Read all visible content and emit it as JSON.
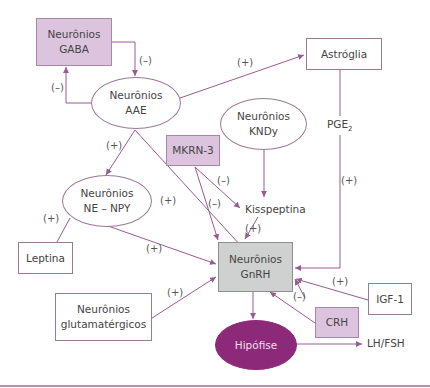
{
  "nodes": {
    "gaba": {
      "line1": "Neurônios",
      "line2": "GABA"
    },
    "aae": {
      "line1": "Neurônios",
      "line2": "AAE"
    },
    "astroglia": {
      "label": "Astróglia"
    },
    "kndy": {
      "line1": "Neurônios",
      "line2": "KNDy"
    },
    "mkrn3": {
      "label": "MKRN-3"
    },
    "ne_npy": {
      "line1": "Neurônios",
      "line2": "NE – NPY"
    },
    "kisspeptina": {
      "label": "Kisspeptina"
    },
    "leptina": {
      "label": "Leptina"
    },
    "gnrh": {
      "line1": "Neurônios",
      "line2": "GnRH"
    },
    "igf1": {
      "label": "IGF-1"
    },
    "glutamatergicos": {
      "line1": "Neurônios",
      "line2": "glutamatérgicos"
    },
    "crh": {
      "label": "CRH"
    },
    "hipofise": {
      "label": "Hipófise"
    },
    "lhfsh": {
      "label": "LH/FSH"
    },
    "pge2": {
      "base": "PGE",
      "sub": "2"
    }
  },
  "edges": [
    {
      "from": "Neurônios GABA",
      "to": "Neurônios AAE",
      "sign": "(–)"
    },
    {
      "from": "Neurônios AAE",
      "to": "Neurônios GABA",
      "sign": "(–)"
    },
    {
      "from": "Neurônios AAE",
      "to": "Astróglia",
      "sign": "(+)"
    },
    {
      "from": "Neurônios AAE",
      "to": "Neurônios NE – NPY",
      "sign": "(+)"
    },
    {
      "from": "Neurônios AAE",
      "to": "Neurônios GnRH",
      "sign": "(+)"
    },
    {
      "from": "Astróglia",
      "to": "Neurônios GnRH",
      "via": "PGE2",
      "sign": "(+)"
    },
    {
      "from": "Neurônios KNDy",
      "to": "Kisspeptina",
      "sign": ""
    },
    {
      "from": "MKRN-3",
      "to": "Kisspeptina",
      "sign": "(–)"
    },
    {
      "from": "MKRN-3",
      "to": "Neurônios GnRH",
      "sign": "(–)"
    },
    {
      "from": "Kisspeptina",
      "to": "Neurônios GnRH",
      "sign": "(+)"
    },
    {
      "from": "Leptina",
      "to": "Neurônios NE – NPY",
      "sign": "(+)"
    },
    {
      "from": "Neurônios NE – NPY",
      "to": "Neurônios GnRH",
      "sign": "(+)"
    },
    {
      "from": "Neurônios glutamatérgicos",
      "to": "Neurônios GnRH",
      "sign": "(+)"
    },
    {
      "from": "IGF-1",
      "to": "Neurônios GnRH",
      "sign": "(+)"
    },
    {
      "from": "CRH",
      "to": "Neurônios GnRH",
      "sign": "(–)"
    },
    {
      "from": "Neurônios GnRH",
      "to": "Hipófise",
      "sign": ""
    },
    {
      "from": "Hipófise",
      "to": "LH/FSH",
      "sign": ""
    }
  ],
  "signs": {
    "gaba_to_aae": "(–)",
    "aae_to_gaba": "(–)",
    "aae_to_astroglia": "(+)",
    "aae_to_nenpy": "(+)",
    "aae_to_gnrh": "(+)",
    "pge2_to_gnrh": "(+)",
    "mkrn3_to_kiss": "(–)",
    "mkrn3_to_gnrh": "(–)",
    "kiss_to_gnrh": "(+)",
    "leptina": "(+)",
    "nenpy_to_gnrh": "(+)",
    "glut_to_gnrh": "(+)",
    "igf1_to_gnrh": "(+)",
    "crh_to_gnrh": "(–)"
  },
  "colors": {
    "line": "#9a5a92",
    "purple_fill": "#dcc4de",
    "gray_fill": "#cfd1d0",
    "hipofise_fill": "#8c2a79"
  }
}
